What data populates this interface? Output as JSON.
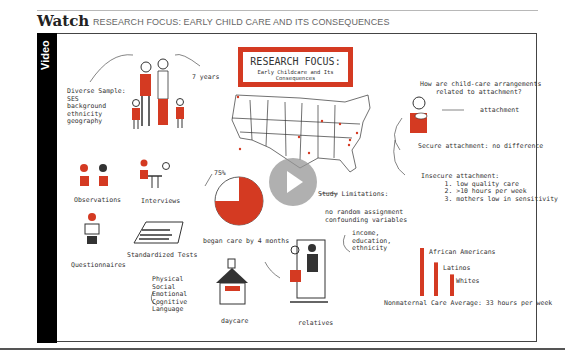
{
  "header": {
    "section_label": "Watch",
    "title": "RESEARCH FOCUS: EARLY CHILD CARE AND ITS CONSEQUENCES"
  },
  "video": {
    "side_label": "Video",
    "play_icon": "play-icon",
    "board": {
      "title_main": "RESEARCH FOCUS:",
      "title_sub": "Early Childcare and Its Consequences",
      "diverse_sample": "Diverse Sample:\nSES\nbackground\nethnicity\ngeography",
      "years": "7 years",
      "observations": "Observations",
      "interviews": "Interviews",
      "questionnaires": "Questionnaires",
      "standardized_tests": "Standardized Tests",
      "domains": "Physical\nSocial\nEmotional\nCognitive\nLanguage",
      "pie_label": "75%",
      "pie_value": 0.75,
      "began_care": "began care by 4 months",
      "daycare": "daycare",
      "relatives": "relatives",
      "study_limitations": "Study Limitations:",
      "limitations_detail": "no random assignment\nconfounding variables",
      "confounds": "income,\neducation,\nethnicity",
      "question": "How are child-care arrangements\n    related to attachment?",
      "attachment": "attachment",
      "secure": "Secure attachment: no difference",
      "insecure": "Insecure attachment:\n      1. low quality care\n      2. >10 hours per week\n      3. mothers low in sensitivity",
      "groups": [
        "African Americans",
        "Latinos",
        "Whites"
      ],
      "group_bar_levels": [
        1.0,
        0.7,
        0.45
      ],
      "average": "Nonmaternal Care Average: 33 hours per week"
    },
    "accent_color": "#d43a22"
  }
}
